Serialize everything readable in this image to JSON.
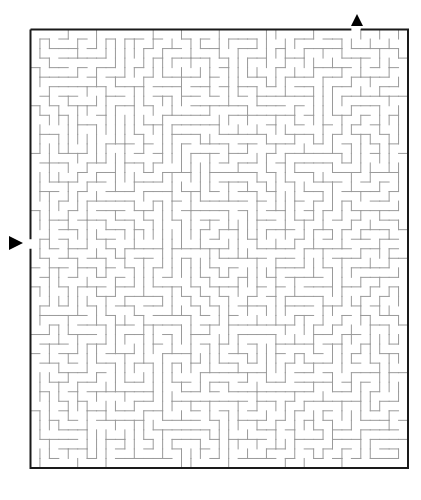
{
  "page": {
    "title": "",
    "background": "#ffffff"
  },
  "maze": {
    "cols": 40,
    "rows": 46,
    "origin_x": 30.5,
    "origin_y": 29.5,
    "width": 377.5,
    "height": 438.5,
    "seed": 20240611,
    "inner_wall_color": "#9a9a9a",
    "inner_wall_width": 1,
    "outer_wall_color": "#1a1a1a",
    "outer_wall_width": 2,
    "entrance": {
      "side": "top",
      "cell": 34,
      "arrow": {
        "x": 357,
        "y": 20,
        "direction": "down-pointing-up",
        "color": "#000000"
      }
    },
    "exit": {
      "side": "left",
      "cell": 22,
      "arrow": {
        "x": 16,
        "y": 243,
        "direction": "right",
        "color": "#000000"
      }
    }
  },
  "icons": {
    "entrance_marker": "triangle-up-icon",
    "exit_marker": "triangle-right-icon"
  }
}
